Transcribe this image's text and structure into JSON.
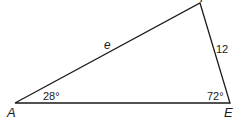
{
  "figure": {
    "type": "triangle",
    "vertices": [
      {
        "label": "A",
        "x": 15,
        "y": 103
      },
      {
        "label": "E",
        "x": 230,
        "y": 103
      },
      {
        "label": "F",
        "x": 200,
        "y": 3
      }
    ],
    "angles": {
      "A": "28°",
      "E": "72°"
    },
    "sides": {
      "AF": "e",
      "FE": "12"
    },
    "colors": {
      "stroke": "#1a1a1a",
      "background": "#ffffff"
    }
  }
}
